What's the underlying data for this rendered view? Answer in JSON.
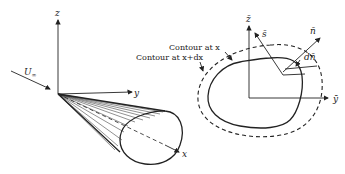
{
  "left_figure": {
    "axes": {
      "z": "z",
      "y": "y",
      "x": "x"
    },
    "freestream_label": "U",
    "freestream_subscript": "∞"
  },
  "right_figure": {
    "axes": {
      "z": "z̄",
      "y": "ȳ"
    },
    "vectors": {
      "s": "s̄",
      "n": "n̄",
      "dn": "dn̄"
    },
    "labels": {
      "contour_x": "Contour at x",
      "contour_x_dx": "Contour at x+dx"
    }
  }
}
